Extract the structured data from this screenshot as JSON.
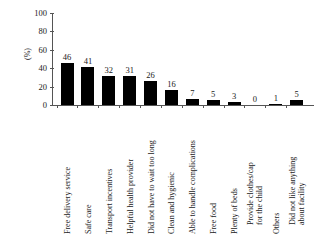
{
  "chart_data": {
    "type": "bar",
    "title": "",
    "subtitle": "",
    "xlabel": "",
    "ylabel": "(%)",
    "ylim": [
      0,
      100
    ],
    "yticks": [
      0,
      20,
      40,
      60,
      80,
      100
    ],
    "grid": false,
    "legend": null,
    "orientation": "vertical",
    "bar_color": "#000000",
    "categories": [
      "Free delivery service",
      "Safe care",
      "Transport incentives",
      "Helpful health provider",
      "Did not have to wait too long",
      "Clean and hygienic",
      "Able to handle complications",
      "Free food",
      "Plenty of beds",
      "Provide clothes/cap for the child",
      "Others",
      "Did not like anything about facility"
    ],
    "category_lines": [
      [
        "Free delivery service"
      ],
      [
        "Safe care"
      ],
      [
        "Transport incentives"
      ],
      [
        "Helpful health provider"
      ],
      [
        "Did not have to wait too long"
      ],
      [
        "Clean and hygienic"
      ],
      [
        "Able to handle complications"
      ],
      [
        "Free food"
      ],
      [
        "Plenty of beds"
      ],
      [
        "Provide clothes/cap",
        "for the child"
      ],
      [
        "Others"
      ],
      [
        "Did not like anything",
        "about facility"
      ]
    ],
    "values": [
      46,
      41,
      32,
      31,
      26,
      16,
      7,
      5,
      3,
      0,
      1,
      5
    ],
    "value_labels": [
      "46",
      "41",
      "32",
      "31",
      "26",
      "16",
      "7",
      "5",
      "3",
      "0",
      "1",
      "5"
    ]
  }
}
